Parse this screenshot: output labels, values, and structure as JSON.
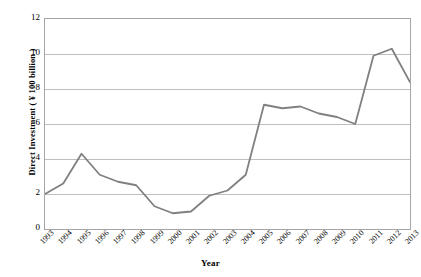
{
  "chart_data": {
    "type": "line",
    "title": "",
    "xlabel": "Year",
    "ylabel": "Direct Investment ( ¥ 100 billion )",
    "categories": [
      "1993",
      "1994",
      "1995",
      "1996",
      "1997",
      "1998",
      "1999",
      "2000",
      "2001",
      "2002",
      "2003",
      "2004",
      "2005",
      "2006",
      "2007",
      "2008",
      "2009",
      "2010",
      "2011",
      "2012",
      "2013"
    ],
    "values": [
      2.0,
      2.6,
      4.3,
      3.1,
      2.7,
      2.5,
      1.3,
      0.9,
      1.0,
      1.9,
      2.2,
      3.1,
      7.1,
      6.9,
      7.0,
      6.6,
      6.4,
      6.0,
      9.9,
      10.3,
      8.4
    ],
    "series": [
      {
        "name": "Direct Investment",
        "values": [
          2.0,
          2.6,
          4.3,
          3.1,
          2.7,
          2.5,
          1.3,
          0.9,
          1.0,
          1.9,
          2.2,
          3.1,
          7.1,
          6.9,
          7.0,
          6.6,
          6.4,
          6.0,
          9.9,
          10.3,
          8.4
        ],
        "color": "#808080"
      }
    ],
    "ylim": [
      0,
      12
    ],
    "y_ticks": [
      0,
      2,
      4,
      6,
      8,
      10,
      12
    ],
    "y_tick_labels": [
      "0",
      "2",
      "4",
      "6",
      "8",
      "10",
      "12"
    ],
    "grid": "horizontal",
    "legend": "none",
    "line_color": "#808080",
    "grid_color": "#bfbfbf",
    "axis_color": "#a6a6a6",
    "background": "#ffffff"
  }
}
